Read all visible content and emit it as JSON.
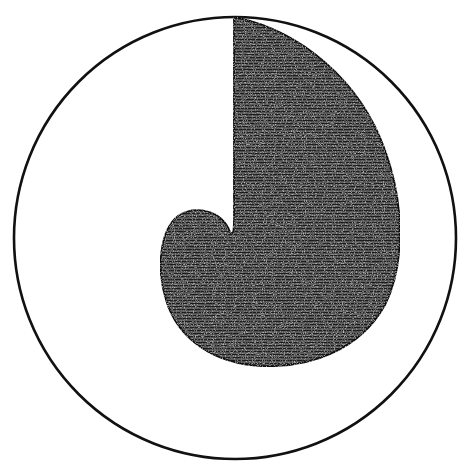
{
  "figure": {
    "type": "engraving-diagram",
    "circle": {
      "cx": 235,
      "cy": 238,
      "r": 221,
      "stroke": "#111111",
      "stroke_width": 2.5
    },
    "shape": {
      "fill": "#2b2b2b",
      "hatch_color": "#8a8a8a",
      "outline": "#111111"
    }
  }
}
